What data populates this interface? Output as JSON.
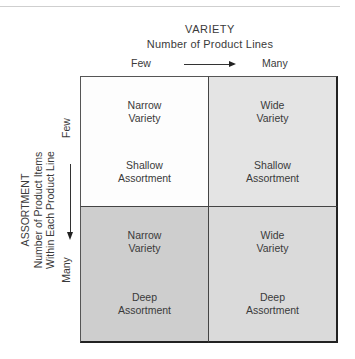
{
  "x_axis": {
    "title": "VARIETY",
    "subtitle": "Number of Product Lines",
    "low_label": "Few",
    "high_label": "Many",
    "arrow": "arrow-right-icon"
  },
  "y_axis": {
    "title": "ASSORTMENT",
    "subtitle_line1": "Number of Product Items",
    "subtitle_line2": "Within Each Product Line",
    "low_label": "Few",
    "high_label": "Many",
    "arrow": "arrow-down-icon"
  },
  "matrix": {
    "cells": [
      {
        "position": "top-left",
        "line1": "Narrow\nVariety",
        "line2": "Shallow\nAssortment",
        "color": "#fdfdfd"
      },
      {
        "position": "top-right",
        "line1": "Wide\nVariety",
        "line2": "Shallow\nAssortment",
        "color": "#e4e4e4"
      },
      {
        "position": "bottom-left",
        "line1": "Narrow\nVariety",
        "line2": "Deep\nAssortment",
        "color": "#cecece"
      },
      {
        "position": "bottom-right",
        "line1": "Wide\nVariety",
        "line2": "Deep\nAssortment",
        "color": "#dadada"
      }
    ]
  }
}
